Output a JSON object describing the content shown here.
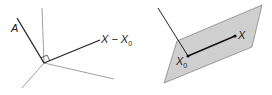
{
  "left_figure": {
    "labels": {
      "normal_vector": "A",
      "displacement_main": "X − X",
      "displacement_sub": "0"
    },
    "right_angle_marker": true
  },
  "right_figure": {
    "labels": {
      "point_x": "X",
      "point_x0_main": "X",
      "point_x0_sub": "0"
    },
    "plane_fill": "#cfcfcf",
    "plane_stroke": "#555555"
  },
  "colors": {
    "thin_line": "#777777",
    "thick_line": "#222222"
  }
}
